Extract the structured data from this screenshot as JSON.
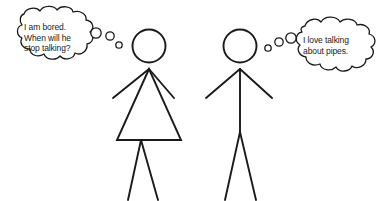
{
  "scene": {
    "title": "Two stick figures with thought bubbles",
    "width": 383,
    "height": 201,
    "background_color": "#ffffff",
    "ink_color": "#1a1a1a",
    "text_color": "#1a1a1a"
  },
  "left_character": {
    "name": "bored-listener-female-stick-figure",
    "gender_styling": "triangle-dress",
    "thought": {
      "text": "I am bored.\nWhen will he\nstop talking?",
      "lines": [
        "I am bored.",
        "When will he",
        "stop talking?"
      ],
      "bubble_shape": "cloud",
      "tail_direction": "right",
      "tail_bubble_count": 3
    }
  },
  "right_character": {
    "name": "talking-male-stick-figure",
    "gender_styling": "straight-body",
    "thought": {
      "text": "I love talking\nabout pipes.",
      "lines": [
        "I love talking",
        "about pipes."
      ],
      "bubble_shape": "cloud",
      "tail_direction": "left",
      "tail_bubble_count": 3
    }
  }
}
